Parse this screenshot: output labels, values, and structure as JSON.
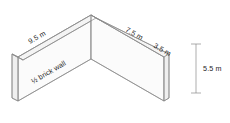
{
  "drawing": {
    "title": "Isometric view of L-shaped half-brick wall",
    "style": {
      "line_color": "#8a8a8a",
      "text_color": "#1c1c1c",
      "face_front_fill": "#fbfbfb",
      "face_top_fill": "#f4f4f4",
      "face_end_fill": "#efefef",
      "background": "#ffffff"
    },
    "dimensions": [
      {
        "id": "left-span",
        "value": "9.5 m",
        "orientation": "along-top-left-edge"
      },
      {
        "id": "right-span",
        "value": "7.5 m",
        "orientation": "along-top-right-edge"
      },
      {
        "id": "return-span",
        "value": "3.5 m",
        "orientation": "along-top-return-edge"
      },
      {
        "id": "height",
        "value": "5.5 m",
        "orientation": "vertical-right"
      }
    ],
    "annotations": [
      {
        "id": "wall-type",
        "value": "½ brick wall",
        "orientation": "along-left-face"
      }
    ]
  }
}
